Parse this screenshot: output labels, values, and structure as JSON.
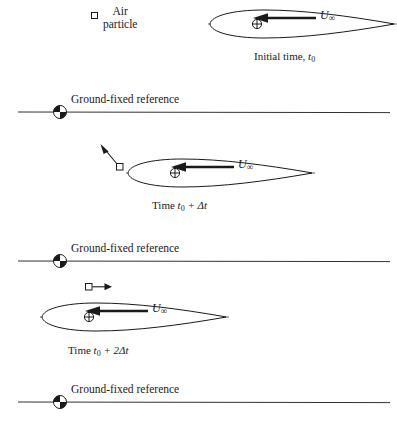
{
  "figure": {
    "width": 397,
    "height": 421,
    "background": "#ffffff",
    "ink": "#1a1a1a"
  },
  "legend": {
    "particle_marker": "air-particle-square",
    "label_line1": "Air",
    "label_line2": "particle"
  },
  "velocity_symbol": {
    "base": "U",
    "subscript": "∞"
  },
  "panels": [
    {
      "id": "panel-initial",
      "caption_prefix": "Initial time,",
      "caption_time": "t",
      "caption_sub": "0",
      "caption_suffix": "",
      "airfoil_x": 208,
      "airfoil_y": 7,
      "airfoil_w": 186,
      "airfoil_h": 30,
      "has_particle_arrow": false,
      "particle_x": 99,
      "particle_y": 14,
      "caption_x": 254,
      "caption_y": 50
    },
    {
      "id": "panel-t0-dt",
      "caption_prefix": "Time",
      "caption_time": "t",
      "caption_sub": "0",
      "caption_suffix": "+ Δt",
      "airfoil_x": 126,
      "airfoil_y": 156,
      "airfoil_w": 186,
      "airfoil_h": 30,
      "has_particle_arrow": true,
      "particle_arrow_kind": "diagonal-up-left",
      "particle_x": 117,
      "particle_y": 165,
      "caption_x": 152,
      "caption_y": 199
    },
    {
      "id": "panel-t0-2dt",
      "caption_prefix": "Time",
      "caption_time": "t",
      "caption_sub": "0",
      "caption_suffix": "+ 2Δt",
      "airfoil_x": 40,
      "airfoil_y": 300,
      "airfoil_w": 186,
      "airfoil_h": 30,
      "has_particle_arrow": true,
      "particle_arrow_kind": "horizontal-right",
      "particle_x": 88,
      "particle_y": 284,
      "caption_x": 68,
      "caption_y": 344
    }
  ],
  "ground_references": [
    {
      "id": "ground-ref-1",
      "label": "Ground-fixed reference",
      "line_y": 112,
      "marker_x": 60,
      "label_x": 71,
      "label_y": 93
    },
    {
      "id": "ground-ref-2",
      "label": "Ground-fixed reference",
      "line_y": 261,
      "marker_x": 60,
      "label_x": 71,
      "label_y": 242
    },
    {
      "id": "ground-ref-3",
      "label": "Ground-fixed reference",
      "line_y": 402,
      "marker_x": 60,
      "label_x": 71,
      "label_y": 383
    }
  ]
}
